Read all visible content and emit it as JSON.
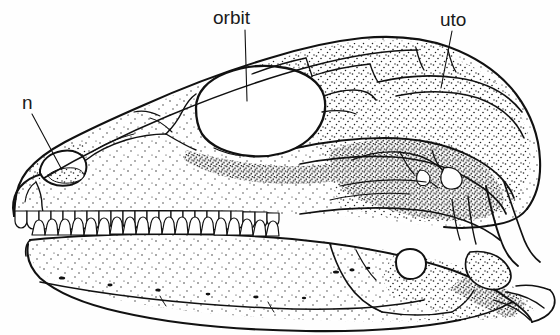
{
  "figure": {
    "type": "scientific-illustration",
    "view": "left lateral",
    "background_color": "#fefefe",
    "ink_color": "#111111",
    "stipple_color": "#222222",
    "width": 560,
    "height": 335
  },
  "labels": [
    {
      "id": "orbit",
      "text": "orbit",
      "x": 213,
      "y": 8,
      "leader": {
        "x1": 245,
        "y1": 30,
        "x2": 247,
        "y2": 101
      }
    },
    {
      "id": "uto",
      "text": "uto",
      "x": 440,
      "y": 10,
      "leader": {
        "x1": 452,
        "y1": 31,
        "x2": 441,
        "y2": 88
      }
    },
    {
      "id": "n",
      "text": "n",
      "x": 22,
      "y": 93,
      "leader": {
        "x1": 32,
        "y1": 114,
        "x2": 62,
        "y2": 170
      }
    }
  ],
  "anatomy": {
    "openings": [
      {
        "name": "orbit",
        "cx": 255,
        "cy": 110,
        "rx": 62,
        "ry": 42
      },
      {
        "name": "external-naris",
        "cx": 58,
        "cy": 166,
        "rx": 22,
        "ry": 15
      },
      {
        "name": "mandibular-fenestra",
        "cx": 410,
        "cy": 265,
        "rx": 16,
        "ry": 14
      }
    ],
    "tooth_rows": [
      {
        "name": "upper-tooth-row",
        "count": 34,
        "y": 212,
        "x_start": 14,
        "x_end": 258
      },
      {
        "name": "lower-tooth-row",
        "count": 33,
        "y": 238,
        "x_start": 30,
        "x_end": 262
      }
    ]
  }
}
